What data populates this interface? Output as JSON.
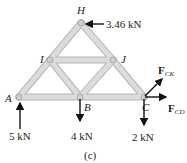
{
  "figure": {
    "caption": "(c)",
    "member_color": "#cfcfcf",
    "member_edge_color": "#b5b5b5",
    "arrow_color": "#111111"
  },
  "joints": {
    "A": {
      "label": "A",
      "x": 19,
      "y": 97
    },
    "B": {
      "label": "B",
      "x": 80,
      "y": 97
    },
    "C": {
      "label": "C",
      "x": 144,
      "y": 97
    },
    "I": {
      "label": "I",
      "x": 50,
      "y": 60
    },
    "J": {
      "label": "J",
      "x": 113,
      "y": 60
    },
    "H": {
      "label": "H",
      "x": 81,
      "y": 23
    }
  },
  "members": [
    [
      "A",
      "B"
    ],
    [
      "B",
      "C"
    ],
    [
      "A",
      "I"
    ],
    [
      "I",
      "H"
    ],
    [
      "H",
      "J"
    ],
    [
      "J",
      "C"
    ],
    [
      "I",
      "J"
    ],
    [
      "I",
      "B"
    ],
    [
      "B",
      "J"
    ]
  ],
  "loads": {
    "H_load": {
      "value": "3.46 kN",
      "direction": "left"
    },
    "A_reaction": {
      "value": "5 kN",
      "direction": "up"
    },
    "B_load": {
      "value": "4 kN",
      "direction": "down"
    },
    "C_load": {
      "value": "2 kN",
      "direction": "down"
    }
  },
  "unknown_forces": {
    "FCK": {
      "symbol": "F",
      "subscript": "CK"
    },
    "FCD": {
      "symbol": "F",
      "subscript": "CD"
    }
  }
}
